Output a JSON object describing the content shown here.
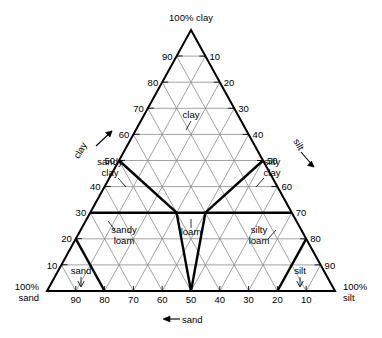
{
  "chart_data": {
    "type": "diagram",
    "apex_label": "100% clay",
    "left_corner_label_line1": "100%",
    "left_corner_label_line2": "sand",
    "right_corner_label_line1": "100%",
    "right_corner_label_line2": "silt",
    "axis_labels": {
      "left": "clay",
      "right": "silt",
      "bottom": "sand",
      "bottom_full": "←sand"
    },
    "grid_interval": 10,
    "axis_range": [
      0,
      100
    ],
    "left_ticks": [
      {
        "value": "90"
      },
      {
        "value": "80"
      },
      {
        "value": "70"
      },
      {
        "value": "60"
      },
      {
        "value": "50"
      },
      {
        "value": "40"
      },
      {
        "value": "30"
      },
      {
        "value": "20"
      },
      {
        "value": "10"
      }
    ],
    "right_ticks": [
      {
        "value": "10"
      },
      {
        "value": "20"
      },
      {
        "value": "30"
      },
      {
        "value": "40"
      },
      {
        "value": "50"
      },
      {
        "value": "60"
      },
      {
        "value": "70"
      },
      {
        "value": "80"
      },
      {
        "value": "90"
      }
    ],
    "bottom_ticks": [
      {
        "value": "90"
      },
      {
        "value": "80"
      },
      {
        "value": "70"
      },
      {
        "value": "60"
      },
      {
        "value": "50"
      },
      {
        "value": "40"
      },
      {
        "value": "30"
      },
      {
        "value": "20"
      },
      {
        "value": "10"
      }
    ],
    "regions": [
      {
        "name": "clay",
        "label": "clay",
        "label_lines": [
          "clay"
        ]
      },
      {
        "name": "sandy-clay",
        "label": "sandy clay",
        "label_lines": [
          "sandy",
          "clay"
        ]
      },
      {
        "name": "silty-clay",
        "label": "silty clay",
        "label_lines": [
          "silty",
          "clay"
        ]
      },
      {
        "name": "sandy-loam",
        "label": "sandy loam",
        "label_lines": [
          "sandy",
          "loam"
        ]
      },
      {
        "name": "loam",
        "label": "loam",
        "label_lines": [
          "loam"
        ]
      },
      {
        "name": "silty-loam",
        "label": "silty loam",
        "label_lines": [
          "silty",
          "loam"
        ]
      },
      {
        "name": "sand",
        "label": "sand",
        "label_lines": [
          "sand"
        ]
      },
      {
        "name": "silt",
        "label": "silt",
        "label_lines": [
          "silt"
        ]
      }
    ],
    "colors": {
      "grid": "#8a8a8a",
      "outline": "#000000",
      "boundary": "#000000",
      "text": "#000000",
      "background": "#ffffff"
    }
  }
}
